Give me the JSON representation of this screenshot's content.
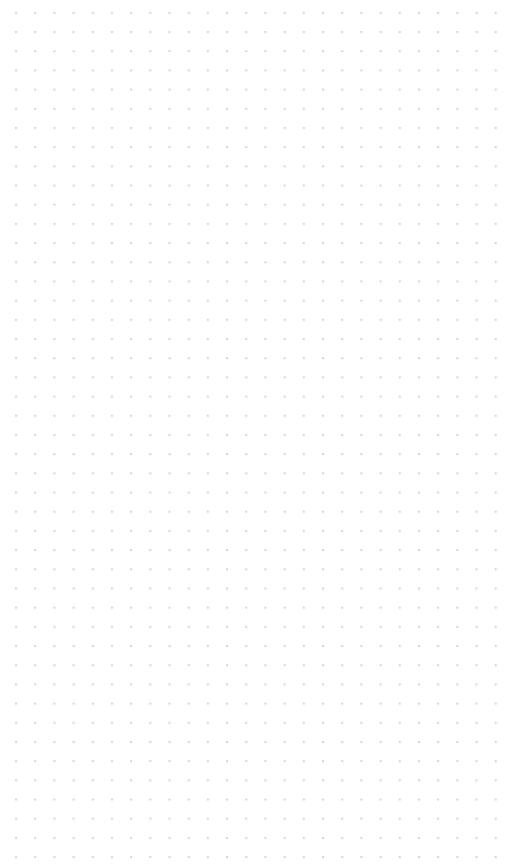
{
  "app": {
    "name": "canvas",
    "surface_label": "Blank canvas",
    "state": "empty"
  },
  "canvas": {
    "width": 506,
    "height": 864,
    "background_color": "#ffffff",
    "zoom_level": "100%",
    "scroll_x": 0,
    "scroll_y": 0,
    "content_items": []
  },
  "grid": {
    "type": "dot-grid",
    "visible": true,
    "dot_color": "#d9d6de",
    "dot_radius_px": 1,
    "spacing_x_px": 19.2,
    "spacing_y_px": 19.2,
    "origin_x_px": 16,
    "origin_y_px": 32,
    "columns": 25,
    "rows": 42,
    "margin_left_px": 16,
    "margin_top_px": 32,
    "margin_right_px": 25,
    "margin_bottom_px": 33
  }
}
